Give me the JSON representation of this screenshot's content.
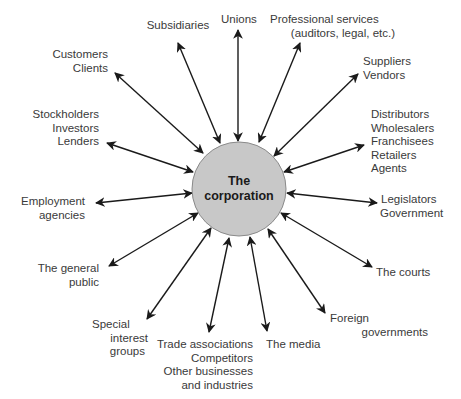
{
  "diagram": {
    "center": {
      "lines": [
        "The",
        "corporation"
      ],
      "fill": "#c8c8c8",
      "stroke": "#8a8a8a"
    },
    "colors": {
      "text": "#3a3a3a",
      "arrow": "#1a1a1a"
    },
    "stakeholders": [
      {
        "id": "subsidiaries",
        "lines": [
          "Subsidiaries"
        ]
      },
      {
        "id": "unions",
        "lines": [
          "Unions"
        ]
      },
      {
        "id": "professional-services",
        "lines": [
          "Professional services",
          "(auditors, legal, etc.)"
        ]
      },
      {
        "id": "customers",
        "lines": [
          "Customers",
          "Clients"
        ]
      },
      {
        "id": "suppliers",
        "lines": [
          "Suppliers",
          "Vendors"
        ]
      },
      {
        "id": "stockholders",
        "lines": [
          "Stockholders",
          "Investors",
          "Lenders"
        ]
      },
      {
        "id": "distributors",
        "lines": [
          "Distributors",
          "Wholesalers",
          "Franchisees",
          "Retailers",
          "Agents"
        ]
      },
      {
        "id": "employment-agencies",
        "lines": [
          "Employment",
          "agencies"
        ]
      },
      {
        "id": "legislators",
        "lines": [
          "Legislators",
          "Government"
        ]
      },
      {
        "id": "general-public",
        "lines": [
          "The general",
          "public"
        ]
      },
      {
        "id": "courts",
        "lines": [
          "The courts"
        ]
      },
      {
        "id": "special-interest",
        "lines": [
          "Special",
          "interest",
          "groups"
        ]
      },
      {
        "id": "foreign-governments",
        "lines": [
          "Foreign",
          "governments"
        ]
      },
      {
        "id": "trade-associations",
        "lines": [
          "Trade associations",
          "Competitors",
          "Other businesses",
          "and industries"
        ]
      },
      {
        "id": "media",
        "lines": [
          "The media"
        ]
      }
    ]
  }
}
